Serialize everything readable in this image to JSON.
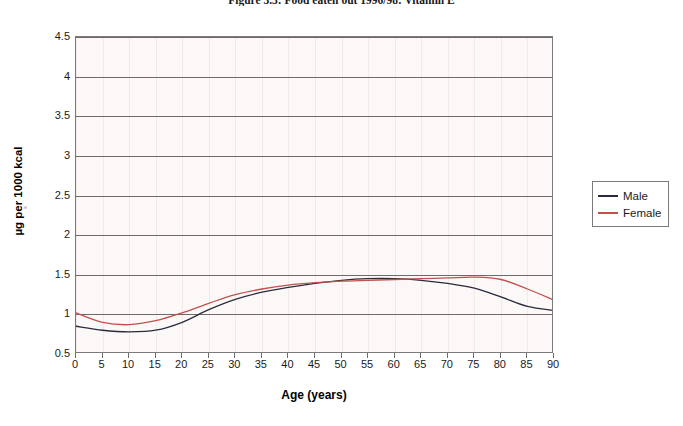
{
  "figure": {
    "title": "Figure 3.3: Food eaten out 1996/98: Vitamin E"
  },
  "legend": {
    "position": "right",
    "items": [
      {
        "label": "Male",
        "color": "#2b2b3c"
      },
      {
        "label": "Female",
        "color": "#c0514d"
      }
    ]
  },
  "chart_data": {
    "type": "line",
    "title": "Figure 3.3: Food eaten out 1996/98: Vitamin E",
    "xlabel": "Age (years)",
    "ylabel": "µg per 1000 kcal",
    "xlim": [
      0,
      90
    ],
    "ylim": [
      0.5,
      4.5
    ],
    "xticks": [
      0,
      5,
      10,
      15,
      20,
      25,
      30,
      35,
      40,
      45,
      50,
      55,
      60,
      65,
      70,
      75,
      80,
      85,
      90
    ],
    "yticks": [
      0.5,
      1,
      1.5,
      2,
      2.5,
      3,
      3.5,
      4,
      4.5
    ],
    "xtick_labels": [
      "0",
      "5",
      "10",
      "15",
      "20",
      "25",
      "30",
      "35",
      "40",
      "45",
      "50",
      "55",
      "60",
      "65",
      "70",
      "75",
      "80",
      "85",
      "90"
    ],
    "ytick_labels": [
      "0.5",
      "1",
      "1.5",
      "2",
      "2.5",
      "3",
      "3.5",
      "4",
      "4.5"
    ],
    "grid": {
      "horizontal": true,
      "vertical": true
    },
    "legend_position": "right",
    "x": [
      0,
      5,
      10,
      15,
      20,
      25,
      30,
      35,
      40,
      45,
      50,
      55,
      60,
      65,
      70,
      75,
      80,
      85,
      90
    ],
    "series": [
      {
        "name": "Male",
        "color": "#2b2b3c",
        "values": [
          0.85,
          0.8,
          0.78,
          0.8,
          0.9,
          1.06,
          1.19,
          1.28,
          1.34,
          1.39,
          1.43,
          1.45,
          1.45,
          1.43,
          1.39,
          1.33,
          1.22,
          1.1,
          1.05
        ]
      },
      {
        "name": "Female",
        "color": "#c0514d",
        "values": [
          1.02,
          0.9,
          0.87,
          0.92,
          1.02,
          1.14,
          1.25,
          1.32,
          1.37,
          1.4,
          1.42,
          1.43,
          1.44,
          1.45,
          1.46,
          1.47,
          1.44,
          1.32,
          1.18
        ]
      }
    ]
  }
}
